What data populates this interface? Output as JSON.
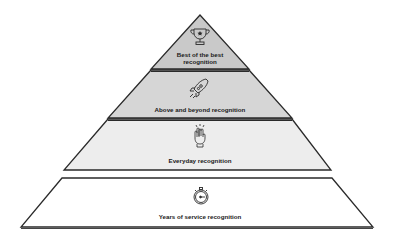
{
  "diagram": {
    "type": "pyramid",
    "levels": [
      {
        "label": "Best of the best recognition",
        "label_line1": "Best of the best",
        "label_line2": "recognition",
        "icon": "trophy-icon",
        "fill": "#c9c9c9"
      },
      {
        "label": "Above and beyond recognition",
        "icon": "rocket-icon",
        "fill": "#d6d6d6"
      },
      {
        "label": "Everyday recognition",
        "icon": "high-five-icon",
        "fill": "#ededed"
      },
      {
        "label": "Years of service recognition",
        "icon": "stopwatch-icon",
        "fill": "#ffffff"
      }
    ],
    "stroke": "#2a2a2a"
  }
}
